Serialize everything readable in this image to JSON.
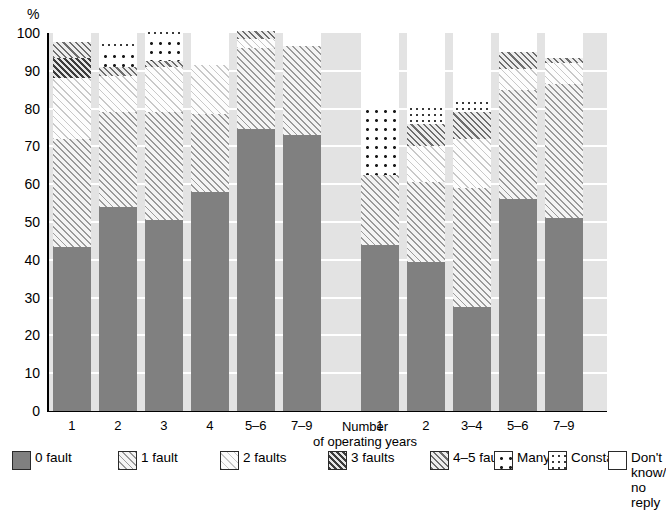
{
  "chart_data": {
    "type": "bar",
    "subtype": "stacked-percentage",
    "title": "",
    "ylabel": "%",
    "xlabel": "Number\nof operating years",
    "ylim": [
      0,
      100
    ],
    "yticks": [
      0,
      10,
      20,
      30,
      40,
      50,
      60,
      70,
      80,
      90,
      100
    ],
    "grid": "horizontal-white",
    "legend_position": "bottom",
    "group_gap_after_index": 5,
    "categories": [
      "1",
      "2",
      "3",
      "4",
      "5–6",
      "7–9",
      "1",
      "2",
      "3–4",
      "5–6",
      "7–9"
    ],
    "series": [
      {
        "name": "0 fault",
        "key": "f0",
        "pattern": "solid-gray",
        "color": "#808080",
        "values": [
          43.5,
          54.0,
          50.5,
          58.0,
          74.5,
          73.0,
          44.0,
          39.5,
          27.5,
          56.0,
          51.0
        ]
      },
      {
        "name": "1 fault",
        "key": "f1",
        "pattern": "diagonal-medium",
        "color": "#9a9a9a",
        "values": [
          28.5,
          25.0,
          28.5,
          20.5,
          21.5,
          23.5,
          18.5,
          21.0,
          31.5,
          29.0,
          35.5
        ]
      },
      {
        "name": "2 faults",
        "key": "f2",
        "pattern": "diagonal-light",
        "color": "#c8c8c8",
        "values": [
          16.0,
          9.5,
          12.0,
          13.0,
          2.5,
          0.0,
          0.0,
          9.5,
          13.0,
          5.5,
          5.5
        ]
      },
      {
        "name": "3 faults",
        "key": "f3",
        "pattern": "diagonal-dark",
        "color": "#3c3c3c",
        "values": [
          5.5,
          0.0,
          0.0,
          0.0,
          0.0,
          0.0,
          0.0,
          0.0,
          0.0,
          0.0,
          0.0
        ]
      },
      {
        "name": "4–5 faults",
        "key": "f45",
        "pattern": "diagonal-gray",
        "color": "#6e6e6e",
        "values": [
          4.0,
          2.5,
          1.5,
          0.0,
          2.0,
          0.0,
          0.0,
          6.0,
          7.0,
          4.5,
          1.5
        ]
      },
      {
        "name": "Many",
        "key": "many",
        "pattern": "dots-large",
        "color": "#1a1a1a",
        "values": [
          0.0,
          4.5,
          6.5,
          0.0,
          0.0,
          0.0,
          18.5,
          0.0,
          0.0,
          0.0,
          0.0
        ]
      },
      {
        "name": "Constant",
        "key": "const",
        "pattern": "dots-small",
        "color": "#3a3a3a",
        "values": [
          0.0,
          2.5,
          2.0,
          0.0,
          0.0,
          0.0,
          0.0,
          5.0,
          3.5,
          0.0,
          0.0
        ]
      },
      {
        "name": "Don't know/\nno reply",
        "key": "dk",
        "pattern": "empty-white",
        "color": "#ffffff",
        "values": [
          2.5,
          2.0,
          1.0,
          8.5,
          0.0,
          3.5,
          19.0,
          19.0,
          17.5,
          5.0,
          6.5
        ]
      }
    ]
  },
  "axis": {
    "y_unit": "%",
    "y_tick_labels": [
      "100",
      "90",
      "80",
      "70",
      "60",
      "50",
      "40",
      "30",
      "20",
      "10",
      "0"
    ],
    "x_tick_labels": [
      "1",
      "2",
      "3",
      "4",
      "5–6",
      "7–9",
      "1",
      "2",
      "3–4",
      "5–6",
      "7–9"
    ],
    "x_axis_title_line1": "Number",
    "x_axis_title_line2": "of operating years"
  },
  "legend": {
    "items": [
      {
        "label": "0 fault",
        "key": "f0"
      },
      {
        "label": "1 fault",
        "key": "f1"
      },
      {
        "label": "2 faults",
        "key": "f2"
      },
      {
        "label": "3 faults",
        "key": "f3"
      },
      {
        "label": "4–5 faults",
        "key": "f45"
      },
      {
        "label": "Many",
        "key": "many"
      },
      {
        "label": "Constant",
        "key": "const"
      },
      {
        "label": "Don't know/\nno reply",
        "key": "dk"
      }
    ]
  },
  "colors": {
    "plot_background": "#e3e3e3",
    "gridline": "#ffffff",
    "axis": "#000000",
    "bar_0_fault": "#808080",
    "page_background": "#ffffff"
  }
}
